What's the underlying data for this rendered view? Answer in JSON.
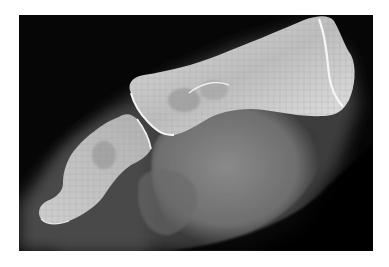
{
  "image": {
    "type": "radiograph",
    "subject": "lateral x-ray of toe phalanges",
    "background_color": "#ffffff",
    "film_color": "#060606",
    "bone_color": "#e8e8e8",
    "soft_tissue_color": "#7a7a7a",
    "elements": [
      {
        "name": "proximal-phalanx",
        "description": "large elongated bone, upper right"
      },
      {
        "name": "distal-phalanx",
        "description": "smaller bone, lower left"
      },
      {
        "name": "soft-tissue",
        "description": "grey soft tissue shadow below bones"
      }
    ]
  }
}
